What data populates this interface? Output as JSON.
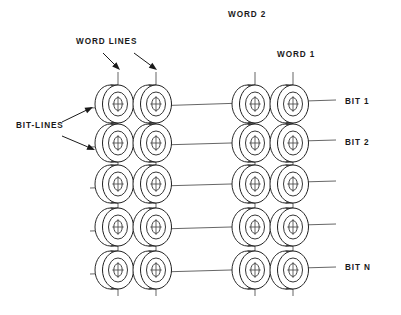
{
  "figure": {
    "kind": "magnetic-core-memory-array",
    "background_color": "#ffffff",
    "ink_color": "#1f1f1f",
    "wire_color": "#4a4a4a"
  },
  "labels": {
    "word_lines": "WORD LINES",
    "bit_lines": "BIT-LINES",
    "word_2": "WORD 2",
    "word_1": "WORD 1",
    "bit_1": "BIT 1",
    "bit_2": "BIT 2",
    "bit_n": "BIT N"
  },
  "label_positions": {
    "word_lines": {
      "x": 76,
      "y": 44
    },
    "bit_lines": {
      "x": 16,
      "y": 128
    },
    "word_2": {
      "x": 228,
      "y": 17
    },
    "word_1": {
      "x": 277,
      "y": 57
    },
    "bit_1": {
      "x": 345,
      "y": 104
    },
    "bit_2": {
      "x": 345,
      "y": 145
    },
    "bit_n": {
      "x": 345,
      "y": 270
    }
  },
  "array": {
    "columns": 4,
    "rows": 5,
    "column_x": [
      118,
      156,
      255,
      293
    ],
    "row_y": [
      104,
      143,
      184,
      227,
      270
    ],
    "core": {
      "ring_rx": 15.5,
      "ring_ry": 19.0,
      "mid_rx": 9.5,
      "mid_ry": 12.0,
      "hole_rx": 4.2,
      "hole_ry": 6.4,
      "depth_dx": -7.5
    }
  },
  "word_lines": [
    {
      "name": "word-line-col-1",
      "x": 118,
      "y_top": 72,
      "y_bottom": 296
    },
    {
      "name": "word-line-col-2",
      "x": 156,
      "y_top": 72,
      "y_bottom": 296
    },
    {
      "name": "word-line-col-3",
      "x": 255,
      "y_top": 72,
      "y_bottom": 296
    },
    {
      "name": "word-line-col-4",
      "x": 293,
      "y_top": 72,
      "y_bottom": 296
    }
  ],
  "bit_lines": [
    {
      "name": "bit-line-1",
      "label": "BIT 1",
      "x_start": 90,
      "y_start": 108,
      "x_end": 336,
      "y_end": 100
    },
    {
      "name": "bit-line-2",
      "label": "BIT 2",
      "x_start": 90,
      "y_start": 147,
      "x_end": 336,
      "y_end": 140
    },
    {
      "name": "bit-line-3",
      "label": "",
      "x_start": 90,
      "y_start": 188,
      "x_end": 336,
      "y_end": 181
    },
    {
      "name": "bit-line-4",
      "label": "",
      "x_start": 90,
      "y_start": 231,
      "x_end": 336,
      "y_end": 224
    },
    {
      "name": "bit-line-5",
      "label": "BIT N",
      "x_start": 90,
      "y_start": 274,
      "x_end": 336,
      "y_end": 267
    }
  ],
  "pointers": [
    {
      "name": "word-lines-arrow-left",
      "x1": 103,
      "y1": 53,
      "x2": 120,
      "y2": 70
    },
    {
      "name": "word-lines-arrow-right",
      "x1": 134,
      "y1": 53,
      "x2": 157,
      "y2": 70
    },
    {
      "name": "bit-lines-arrow-upper",
      "x1": 62,
      "y1": 122,
      "x2": 93,
      "y2": 107
    },
    {
      "name": "bit-lines-arrow-lower",
      "x1": 62,
      "y1": 136,
      "x2": 95,
      "y2": 150
    }
  ]
}
